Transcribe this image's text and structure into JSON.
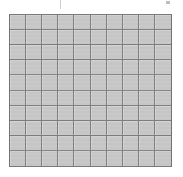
{
  "figure": {
    "type": "blank-grid",
    "rows": 10,
    "columns": 10,
    "total_cells": 100,
    "filled_cells": 0,
    "cell_labels": [],
    "colors": {
      "cell_fill": "#c6c6c6",
      "grid_line": "#7d7d7d",
      "outer_border": "#6f6f6f",
      "background": "#ffffff",
      "artifact": "#cfcfcf"
    },
    "bounds": {
      "left": 9,
      "top": 14,
      "width": 163,
      "height": 153
    }
  },
  "artifacts": [
    {
      "name": "tick-left",
      "x": 60,
      "y": 0,
      "width": 1,
      "height": 9
    },
    {
      "name": "mark-right",
      "x": 166,
      "y": 1,
      "width": 4,
      "height": 3
    }
  ],
  "chart_data": {
    "type": "heatmap",
    "title": "",
    "subtitle": "",
    "xlabel": "",
    "ylabel": "",
    "categories": [
      "1",
      "2",
      "3",
      "4",
      "5",
      "6",
      "7",
      "8",
      "9",
      "10"
    ],
    "rows": [
      "1",
      "2",
      "3",
      "4",
      "5",
      "6",
      "7",
      "8",
      "9",
      "10"
    ],
    "values": [
      [
        0,
        0,
        0,
        0,
        0,
        0,
        0,
        0,
        0,
        0
      ],
      [
        0,
        0,
        0,
        0,
        0,
        0,
        0,
        0,
        0,
        0
      ],
      [
        0,
        0,
        0,
        0,
        0,
        0,
        0,
        0,
        0,
        0
      ],
      [
        0,
        0,
        0,
        0,
        0,
        0,
        0,
        0,
        0,
        0
      ],
      [
        0,
        0,
        0,
        0,
        0,
        0,
        0,
        0,
        0,
        0
      ],
      [
        0,
        0,
        0,
        0,
        0,
        0,
        0,
        0,
        0,
        0
      ],
      [
        0,
        0,
        0,
        0,
        0,
        0,
        0,
        0,
        0,
        0
      ],
      [
        0,
        0,
        0,
        0,
        0,
        0,
        0,
        0,
        0,
        0
      ],
      [
        0,
        0,
        0,
        0,
        0,
        0,
        0,
        0,
        0,
        0
      ],
      [
        0,
        0,
        0,
        0,
        0,
        0,
        0,
        0,
        0,
        0
      ]
    ],
    "grid": true,
    "legend": "none",
    "tick_labels_x": [],
    "tick_labels_y": [],
    "annotations": []
  }
}
